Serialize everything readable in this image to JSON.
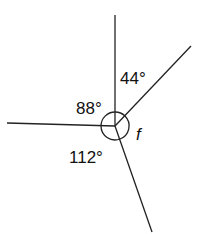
{
  "diagram": {
    "angles": [
      {
        "label": "44°",
        "between": [
          "up",
          "upper-right"
        ]
      },
      {
        "label": "88°",
        "between": [
          "up",
          "left"
        ]
      },
      {
        "label": "112°",
        "between": [
          "left",
          "lower-right"
        ]
      },
      {
        "label": "f",
        "between": [
          "upper-right",
          "lower-right"
        ],
        "unknown": true
      }
    ],
    "line_color": "#222222"
  }
}
